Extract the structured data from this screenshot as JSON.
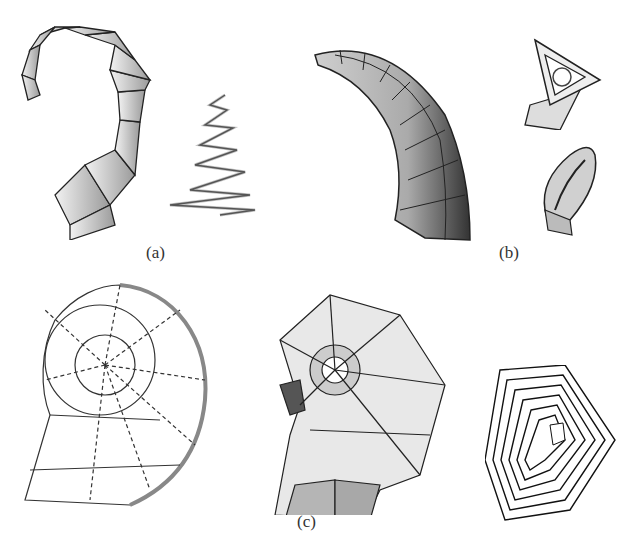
{
  "figure": {
    "panels": [
      {
        "id": "a",
        "label": "(a)",
        "models": [
          "curled-horn-model",
          "zigzag-spiral-model"
        ]
      },
      {
        "id": "b",
        "label": "(b)",
        "models": [
          "tapered-horn-model",
          "triangular-frame-model",
          "oval-ring-model"
        ]
      },
      {
        "id": "c",
        "label": "(c)",
        "models": [
          "planispiral-shell-wireframe",
          "shaded-spiral-shell",
          "hexagonal-tube-stack"
        ]
      }
    ],
    "colors": {
      "background": "#ffffff",
      "stroke": "#222222",
      "light_fill": "#e6e6e6",
      "mid_fill": "#b8b8b8",
      "dark_fill": "#555555"
    }
  }
}
